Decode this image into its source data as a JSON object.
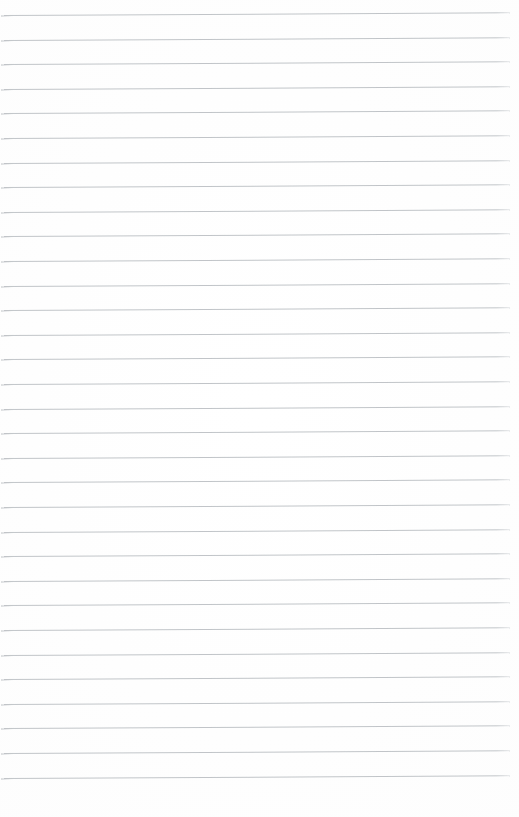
{
  "document": {
    "kind": "blank-lined-paper",
    "page_width": 519,
    "page_height": 817,
    "background_color": "#ffffff",
    "content_text": "",
    "has_margin_rule": false,
    "has_header": false,
    "has_page_number": false,
    "has_handwriting": false
  },
  "ruling": {
    "line_color": "#bcc0c4",
    "line_thickness_px": 1,
    "line_count": 32,
    "line_spacing_px": 24.6,
    "first_line_y": 15,
    "last_line_y": 790,
    "line_start_x": 4,
    "line_end_x": 510,
    "skew_degrees": -0.3,
    "lines": [
      {
        "index": 1,
        "y": 15.0,
        "x_start": 4,
        "x_end": 510
      },
      {
        "index": 2,
        "y": 39.6,
        "x_start": 4,
        "x_end": 510
      },
      {
        "index": 3,
        "y": 64.2,
        "x_start": 4,
        "x_end": 510
      },
      {
        "index": 4,
        "y": 88.8,
        "x_start": 4,
        "x_end": 510
      },
      {
        "index": 5,
        "y": 113.4,
        "x_start": 4,
        "x_end": 510
      },
      {
        "index": 6,
        "y": 138.0,
        "x_start": 4,
        "x_end": 510
      },
      {
        "index": 7,
        "y": 162.6,
        "x_start": 4,
        "x_end": 510
      },
      {
        "index": 8,
        "y": 187.2,
        "x_start": 4,
        "x_end": 510
      },
      {
        "index": 9,
        "y": 211.8,
        "x_start": 4,
        "x_end": 510
      },
      {
        "index": 10,
        "y": 236.4,
        "x_start": 4,
        "x_end": 510
      },
      {
        "index": 11,
        "y": 261.0,
        "x_start": 4,
        "x_end": 510
      },
      {
        "index": 12,
        "y": 285.6,
        "x_start": 4,
        "x_end": 510
      },
      {
        "index": 13,
        "y": 310.2,
        "x_start": 4,
        "x_end": 510
      },
      {
        "index": 14,
        "y": 334.8,
        "x_start": 4,
        "x_end": 510
      },
      {
        "index": 15,
        "y": 359.4,
        "x_start": 4,
        "x_end": 510
      },
      {
        "index": 16,
        "y": 384.0,
        "x_start": 4,
        "x_end": 510
      },
      {
        "index": 17,
        "y": 408.6,
        "x_start": 4,
        "x_end": 510
      },
      {
        "index": 18,
        "y": 433.2,
        "x_start": 4,
        "x_end": 510
      },
      {
        "index": 19,
        "y": 457.8,
        "x_start": 4,
        "x_end": 510
      },
      {
        "index": 20,
        "y": 482.4,
        "x_start": 4,
        "x_end": 510
      },
      {
        "index": 21,
        "y": 507.0,
        "x_start": 4,
        "x_end": 510
      },
      {
        "index": 22,
        "y": 531.6,
        "x_start": 4,
        "x_end": 510
      },
      {
        "index": 23,
        "y": 556.2,
        "x_start": 4,
        "x_end": 510
      },
      {
        "index": 24,
        "y": 580.8,
        "x_start": 4,
        "x_end": 510
      },
      {
        "index": 25,
        "y": 605.4,
        "x_start": 4,
        "x_end": 510
      },
      {
        "index": 26,
        "y": 630.0,
        "x_start": 4,
        "x_end": 510
      },
      {
        "index": 27,
        "y": 654.6,
        "x_start": 4,
        "x_end": 510
      },
      {
        "index": 28,
        "y": 679.2,
        "x_start": 4,
        "x_end": 510
      },
      {
        "index": 29,
        "y": 703.8,
        "x_start": 4,
        "x_end": 510
      },
      {
        "index": 30,
        "y": 728.4,
        "x_start": 4,
        "x_end": 510
      },
      {
        "index": 31,
        "y": 753.0,
        "x_start": 4,
        "x_end": 510
      },
      {
        "index": 32,
        "y": 777.6,
        "x_start": 4,
        "x_end": 510
      }
    ]
  }
}
